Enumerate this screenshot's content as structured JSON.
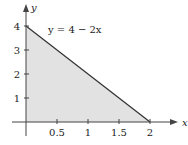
{
  "chart_data": {
    "type": "area",
    "title": "",
    "xlabel": "x",
    "ylabel": "y",
    "annotation": "y = 4 − 2x",
    "xlim": [
      0,
      2
    ],
    "ylim": [
      0,
      4
    ],
    "x_ticks": [
      0.5,
      1,
      1.5,
      2
    ],
    "x_tick_labels": [
      "0.5",
      "1",
      "1.5",
      "2"
    ],
    "y_ticks": [
      1,
      2,
      3,
      4
    ],
    "y_tick_labels": [
      "1",
      "2",
      "3",
      "4"
    ],
    "series": [
      {
        "name": "y = 4 − 2x",
        "x": [
          0,
          2
        ],
        "y": [
          4,
          0
        ]
      }
    ],
    "shaded_region": {
      "vertices": [
        [
          0,
          0
        ],
        [
          0,
          4
        ],
        [
          2,
          0
        ]
      ]
    },
    "grid": false,
    "colors": {
      "fill": "#e2e2e2",
      "line": "#333333",
      "axis": "#444444"
    }
  }
}
